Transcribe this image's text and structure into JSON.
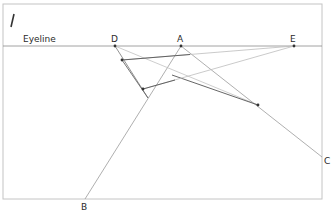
{
  "figure": {
    "fig_number": "/",
    "eyeline_label": "Eyeline",
    "points": {
      "D": {
        "label": "D",
        "x": 115,
        "y": 46
      },
      "A": {
        "label": "A",
        "x": 181,
        "y": 46
      },
      "E": {
        "label": "E",
        "x": 294,
        "y": 46
      },
      "B": {
        "label": "B",
        "x": 85,
        "y": 199
      },
      "C": {
        "label": "C",
        "x": 322,
        "y": 157
      }
    },
    "colors": {
      "frame": "#bdbdbd",
      "line_dark": "#555555",
      "line_light": "#b8b8b8",
      "text": "#2a2a2a"
    }
  }
}
